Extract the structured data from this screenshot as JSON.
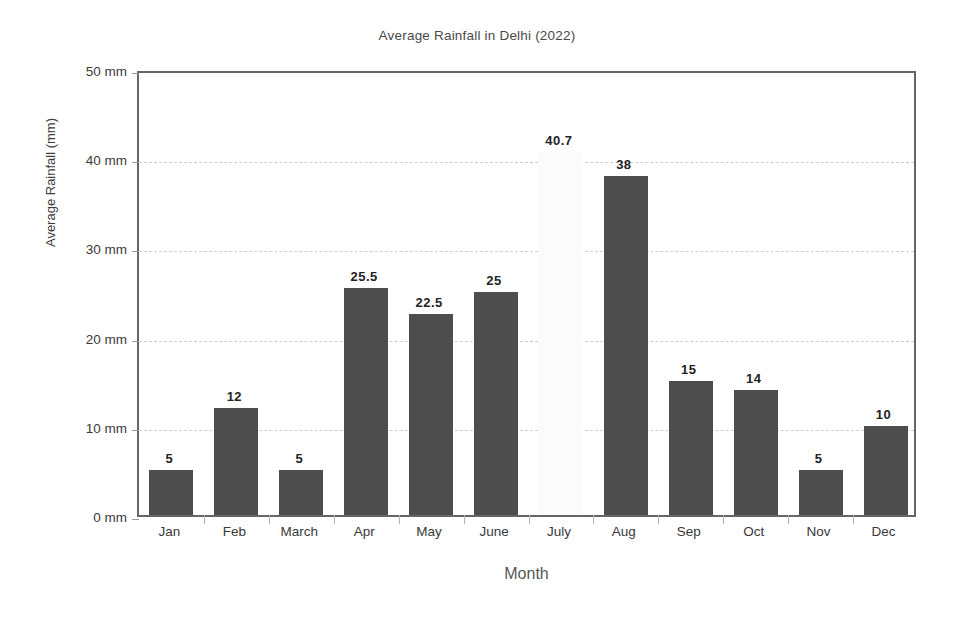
{
  "chart_data": {
    "type": "bar",
    "title": "Average Rainfall in Delhi (2022)",
    "xlabel": "Month",
    "ylabel": "Average Rainfall (mm)",
    "categories": [
      "Jan",
      "Feb",
      "March",
      "Apr",
      "May",
      "June",
      "July",
      "Aug",
      "Sep",
      "Oct",
      "Nov",
      "Dec"
    ],
    "values": [
      5,
      12,
      5,
      25.5,
      22.5,
      25,
      40.7,
      38,
      15,
      14,
      5,
      10
    ],
    "data_labels": [
      "5",
      "12",
      "5",
      "25.5",
      "22.5",
      "25",
      "40.7",
      "38",
      "15",
      "14",
      "5",
      "10"
    ],
    "ylim": [
      0,
      50
    ],
    "yticks": [
      0,
      10,
      20,
      30,
      40,
      50
    ],
    "ytick_labels": [
      "0 mm",
      "10 mm",
      "20 mm",
      "30 mm",
      "40 mm",
      "50 mm"
    ],
    "grid": true,
    "legend": null,
    "bar_color": "#4d4d4d",
    "faint_bar_color": "#fbfbfb",
    "faint_bars": [
      "July"
    ],
    "gridline_color": "#cfcfcf",
    "frame_color": "#666666",
    "background_color": "#ffffff",
    "text_color": "#3a3a3a"
  }
}
